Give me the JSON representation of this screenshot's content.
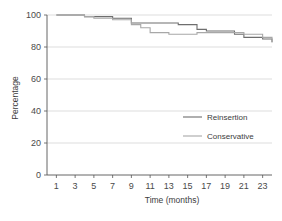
{
  "chart_data": {
    "type": "line",
    "title": "",
    "xlabel": "Time (months)",
    "ylabel": "Percentage",
    "xlim": [
      0,
      24
    ],
    "ylim": [
      0,
      100
    ],
    "grid": true,
    "legend_position": "center-right",
    "xticks": [
      1,
      3,
      5,
      7,
      9,
      11,
      13,
      15,
      17,
      19,
      21,
      23
    ],
    "xtick_labels": [
      "1",
      "3",
      "5",
      "7",
      "9",
      "11",
      "13",
      "15",
      "17",
      "19",
      "21",
      "23"
    ],
    "yticks": [
      0,
      20,
      40,
      60,
      80,
      100
    ],
    "ytick_labels": [
      "0",
      "20",
      "40",
      "60",
      "80",
      "100"
    ],
    "series": [
      {
        "name": "Reinsertion",
        "color": "#6e6e6e",
        "step": "post",
        "x": [
          1,
          3,
          4,
          5,
          7,
          8,
          9,
          13,
          14,
          15,
          16,
          17,
          19,
          20,
          21,
          23,
          24
        ],
        "y": [
          100,
          100,
          99,
          99,
          98,
          98,
          95,
          95,
          94,
          94,
          91,
          90,
          90,
          88,
          86,
          85,
          83
        ]
      },
      {
        "name": "Conservative",
        "color": "#a8a8a8",
        "step": "post",
        "x": [
          1,
          3,
          4,
          5,
          7,
          8,
          9,
          10,
          11,
          13,
          15,
          16,
          17,
          19,
          21,
          22,
          23,
          24
        ],
        "y": [
          100,
          100,
          99,
          98,
          97,
          97,
          94,
          92,
          89,
          88,
          88,
          89,
          89,
          89,
          88,
          88,
          86,
          83
        ]
      }
    ]
  },
  "legend": {
    "items": [
      {
        "label": "Reinsertion",
        "color": "#6e6e6e"
      },
      {
        "label": "Conservative",
        "color": "#a8a8a8"
      }
    ]
  },
  "axis": {
    "x_title": "Time (months)",
    "y_title": "Percentage"
  }
}
